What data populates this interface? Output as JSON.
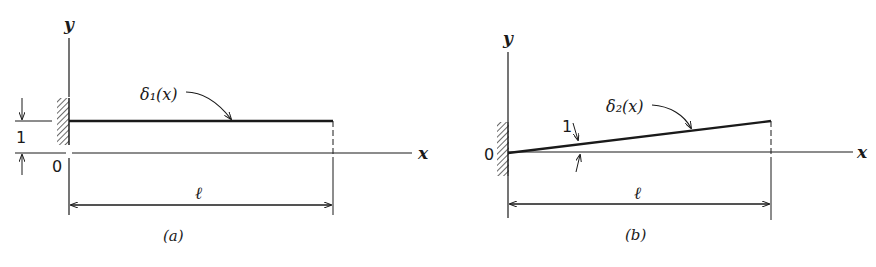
{
  "figure": {
    "panels": [
      {
        "id": "a",
        "caption": "(a)",
        "y_axis_label": "y",
        "x_axis_label": "x",
        "origin_label": "0",
        "function_label": "δ₁(x)",
        "length_label": "ℓ",
        "offset_label": "1",
        "description": "Cantilever with unit uniform displacement δ1(x)=1"
      },
      {
        "id": "b",
        "caption": "(b)",
        "y_axis_label": "y",
        "x_axis_label": "x",
        "origin_label": "0",
        "function_label": "δ₂(x)",
        "length_label": "ℓ",
        "slope_label": "1",
        "description": "Cantilever with unit rotation δ2(x)=x"
      }
    ]
  }
}
